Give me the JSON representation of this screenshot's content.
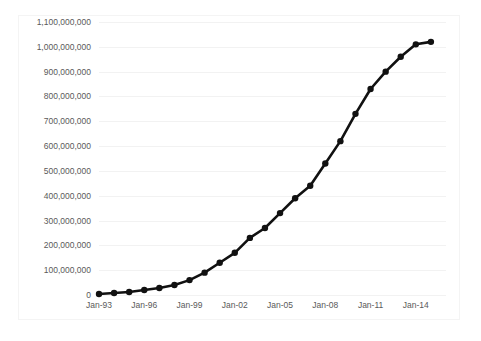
{
  "chart_data": {
    "type": "line",
    "title": "",
    "subtitle": "",
    "xlabel": "",
    "ylabel": "",
    "grid": true,
    "legend": false,
    "legend_position": "none",
    "line_color": "#111111",
    "marker": "circle",
    "marker_color": "#111111",
    "ylim": [
      0,
      1100000000
    ],
    "y_tick_labels": [
      "1,100,000,000",
      "1,000,000,000",
      "900,000,000",
      "800,000,000",
      "700,000,000",
      "600,000,000",
      "500,000,000",
      "400,000,000",
      "300,000,000",
      "200,000,000",
      "100,000,000",
      "0"
    ],
    "y_tick_values": [
      1100000000,
      1000000000,
      900000000,
      800000000,
      700000000,
      600000000,
      500000000,
      400000000,
      300000000,
      200000000,
      100000000,
      0
    ],
    "x_tick_labels": [
      "Jan-93",
      "Jan-96",
      "Jan-99",
      "Jan-02",
      "Jan-05",
      "Jan-08",
      "Jan-11",
      "Jan-14"
    ],
    "x_tick_values": [
      1993,
      1996,
      1999,
      2002,
      2005,
      2008,
      2011,
      2014
    ],
    "xlim": [
      1993,
      2016
    ],
    "categories": [
      "Jan-93",
      "Jan-94",
      "Jan-95",
      "Jan-96",
      "Jan-97",
      "Jan-98",
      "Jan-99",
      "Jan-00",
      "Jan-01",
      "Jan-02",
      "Jan-03",
      "Jan-04",
      "Jan-05",
      "Jan-06",
      "Jan-07",
      "Jan-08",
      "Jan-09",
      "Jan-10",
      "Jan-11",
      "Jan-12",
      "Jan-13",
      "Jan-14",
      "Jan-15"
    ],
    "x": [
      1993,
      1994,
      1995,
      1996,
      1997,
      1998,
      1999,
      2000,
      2001,
      2002,
      2003,
      2004,
      2005,
      2006,
      2007,
      2008,
      2009,
      2010,
      2011,
      2012,
      2013,
      2014,
      2015
    ],
    "values": [
      4000000,
      8000000,
      12000000,
      20000000,
      28000000,
      40000000,
      60000000,
      90000000,
      130000000,
      170000000,
      230000000,
      270000000,
      330000000,
      390000000,
      440000000,
      530000000,
      620000000,
      730000000,
      830000000,
      900000000,
      960000000,
      1010000000,
      1020000000
    ]
  }
}
